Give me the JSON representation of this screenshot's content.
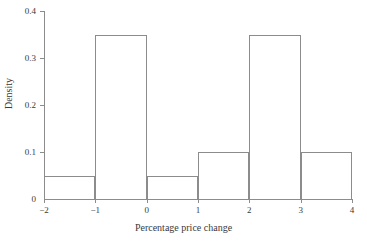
{
  "chart_data": {
    "type": "bar",
    "title": "",
    "xlabel": "Percentage price change",
    "ylabel": "Density",
    "xlim": [
      -2,
      4
    ],
    "ylim": [
      0,
      0.4
    ],
    "grid": false,
    "legend": null,
    "bin_edges": [
      -2,
      -1,
      0,
      1,
      2,
      3,
      4
    ],
    "categories": [
      "-2 to -1",
      "-1 to 0",
      "0 to 1",
      "1 to 2",
      "2 to 3",
      "3 to 4"
    ],
    "values": [
      0.05,
      0.35,
      0.05,
      0.1,
      0.35,
      0.1
    ],
    "xticks": [
      -2,
      -1,
      0,
      1,
      2,
      3,
      4
    ],
    "xticklabels": [
      "−2",
      "−1",
      "0",
      "1",
      "2",
      "3",
      "4"
    ],
    "yticks": [
      0,
      0.1,
      0.2,
      0.3,
      0.4
    ],
    "yticklabels": [
      "0",
      "0.1",
      "0.2",
      "0.3",
      "0.4"
    ],
    "line_color": "#8c8c8c",
    "fill_color": "none",
    "text_color": "#3a3a3a",
    "background": "#ffffff"
  }
}
